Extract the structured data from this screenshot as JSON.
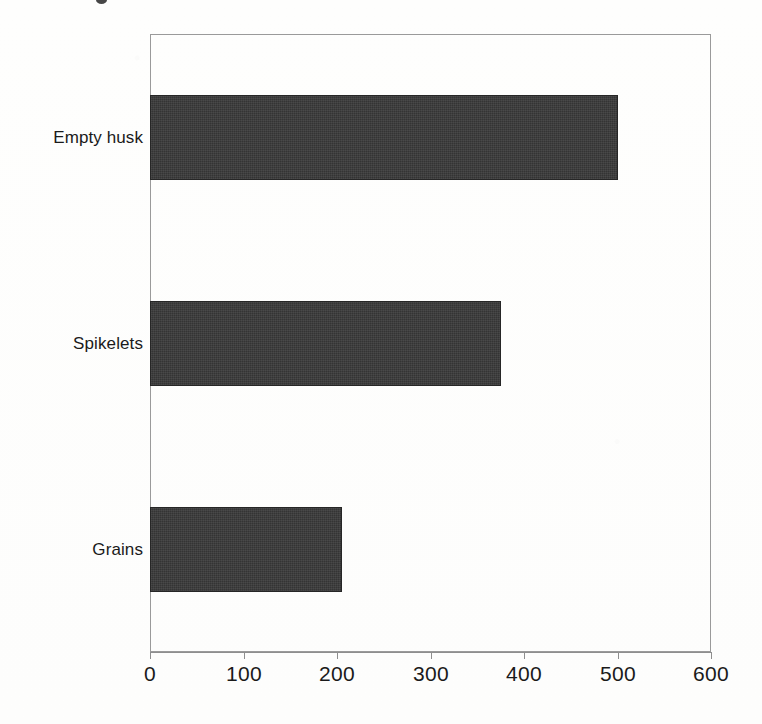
{
  "chart_data": {
    "type": "bar",
    "orientation": "horizontal",
    "title": "",
    "subtitle": "",
    "xlabel": "",
    "ylabel": "",
    "categories": [
      "Empty husk",
      "Spikelets",
      "Grains"
    ],
    "values": [
      500,
      375,
      205
    ],
    "series": [
      {
        "name": "",
        "values": [
          500,
          375,
          205
        ]
      }
    ],
    "xlim": [
      0,
      600
    ],
    "xticks": [
      0,
      100,
      200,
      300,
      400,
      500,
      600
    ],
    "xtick_labels": [
      "0",
      "100",
      "200",
      "300",
      "400",
      "500",
      "600"
    ],
    "grid": false,
    "legend": false,
    "legend_position": "none",
    "bar_color": "#343434",
    "frame_color": "#9a9a9a",
    "text_color": "#1a1a1a",
    "background_color": "#fefefd",
    "annotations": []
  },
  "figure": {
    "plot_area": {
      "left_px": 150,
      "top_px": 34,
      "width_px": 561,
      "height_px": 618
    }
  }
}
